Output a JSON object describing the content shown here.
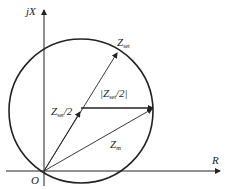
{
  "diagram": {
    "axes": {
      "x_label": "R",
      "y_label": "jX",
      "origin_label": "O"
    },
    "vectors": [
      {
        "name": "Z",
        "sub": "set",
        "text_prefix": "",
        "text_suffix": ""
      },
      {
        "name": "Z",
        "sub": "set",
        "text_prefix": "",
        "text_suffix": "/2"
      },
      {
        "name": "Z",
        "sub": "set",
        "text_prefix": "|",
        "text_suffix": "/2|"
      },
      {
        "name": "Z",
        "sub": "m",
        "text_prefix": "",
        "text_suffix": ""
      }
    ],
    "colors": {
      "stroke": "#222222",
      "background": "#ffffff"
    }
  }
}
